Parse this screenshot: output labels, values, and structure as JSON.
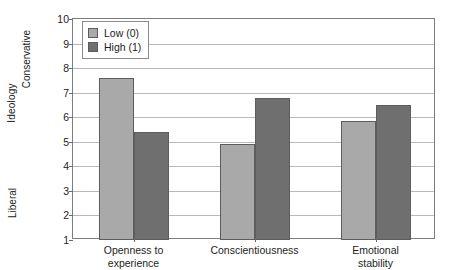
{
  "chart_data": {
    "type": "bar",
    "title": "",
    "xlabel": "",
    "ylabel": "Ideology",
    "ylabel_top": "Conservative",
    "ylabel_bottom": "Liberal",
    "ylim": [
      1,
      10
    ],
    "yticks": [
      10,
      9,
      8,
      7,
      6,
      5,
      4,
      3,
      2,
      1
    ],
    "grid": true,
    "legend_position": "top-left",
    "categories": [
      "Openness to experience",
      "Conscientiousness",
      "Emotional stability"
    ],
    "category_lines": [
      [
        "Openness to",
        "experience"
      ],
      [
        "Conscientiousness",
        ""
      ],
      [
        "Emotional",
        "stability"
      ]
    ],
    "series": [
      {
        "name": "Low (0)",
        "color": "#a9a9a9",
        "values": [
          7.6,
          4.9,
          5.85
        ]
      },
      {
        "name": "High (1)",
        "color": "#6f6f6f",
        "values": [
          5.4,
          6.8,
          6.5
        ]
      }
    ]
  },
  "legend": {
    "items": [
      {
        "label": "Low (0)",
        "swatch": "#a9a9a9"
      },
      {
        "label": "High (1)",
        "swatch": "#6f6f6f"
      }
    ]
  }
}
